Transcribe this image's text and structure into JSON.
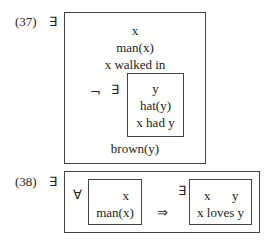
{
  "example37": {
    "number": "(37)",
    "outer_quantifier": "∃",
    "outer_box": {
      "conditions": [
        "x",
        "man(x)",
        "x walked in"
      ],
      "footer": "brown(y)"
    },
    "negation": "¬",
    "inner_quantifier": "∃",
    "inner_box": {
      "conditions": [
        "y",
        "hat(y)",
        "x had y"
      ]
    }
  },
  "example38": {
    "number": "(38)",
    "outer_quantifier": "∃",
    "universal_quantifier": "∀",
    "antecedent_box": {
      "conditions": [
        "x",
        "man(x)"
      ]
    },
    "implication": "⇒",
    "consequent_quantifier": "∃",
    "consequent_box": {
      "referents": [
        "x",
        "y"
      ],
      "conditions": [
        "x loves y"
      ]
    }
  }
}
